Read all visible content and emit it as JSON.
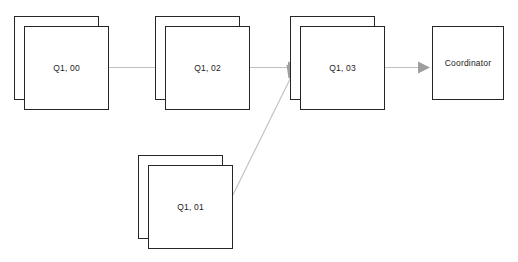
{
  "diagram": {
    "background_color": "#ffffff",
    "node_border_color": "#262626",
    "node_fill_color": "#ffffff",
    "edge_color": "#bbbbbb",
    "arrowhead_color": "#999999",
    "label_color": "#1a1a1a",
    "canvas": {
      "width": 518,
      "height": 262
    }
  },
  "nodes": [
    {
      "id": "q1-00",
      "label": "Q1, 00",
      "shape": "stacked-rectangle",
      "icon": "stacked-task-icon",
      "x": 14,
      "y": 16,
      "width": 85,
      "height": 84,
      "stack_offset": 10
    },
    {
      "id": "q1-02",
      "label": "Q1, 02",
      "shape": "stacked-rectangle",
      "icon": "stacked-task-icon",
      "x": 155,
      "y": 16,
      "width": 85,
      "height": 84,
      "stack_offset": 10
    },
    {
      "id": "q1-03",
      "label": "Q1, 03",
      "shape": "stacked-rectangle",
      "icon": "stacked-task-icon",
      "x": 290,
      "y": 16,
      "width": 85,
      "height": 84,
      "stack_offset": 10
    },
    {
      "id": "q1-01",
      "label": "Q1, 01",
      "shape": "stacked-rectangle",
      "icon": "stacked-task-icon",
      "x": 138,
      "y": 155,
      "width": 85,
      "height": 84,
      "stack_offset": 10
    },
    {
      "id": "coordinator",
      "label": "Coordinator",
      "shape": "rectangle",
      "icon": "coordinator-node-icon",
      "x": 432,
      "y": 26,
      "width": 72,
      "height": 74,
      "stack_offset": 0
    }
  ],
  "edges": [
    {
      "id": "e1",
      "from": "q1-00",
      "to": "q1-02",
      "kind": "arrow",
      "direction": "horizontal"
    },
    {
      "id": "e2",
      "from": "q1-02",
      "to": "q1-03",
      "kind": "arrow",
      "direction": "horizontal"
    },
    {
      "id": "e3",
      "from": "q1-01",
      "to": "q1-03",
      "kind": "arrow",
      "direction": "diagonal"
    },
    {
      "id": "e4",
      "from": "q1-03",
      "to": "coordinator",
      "kind": "arrow",
      "direction": "horizontal"
    }
  ]
}
